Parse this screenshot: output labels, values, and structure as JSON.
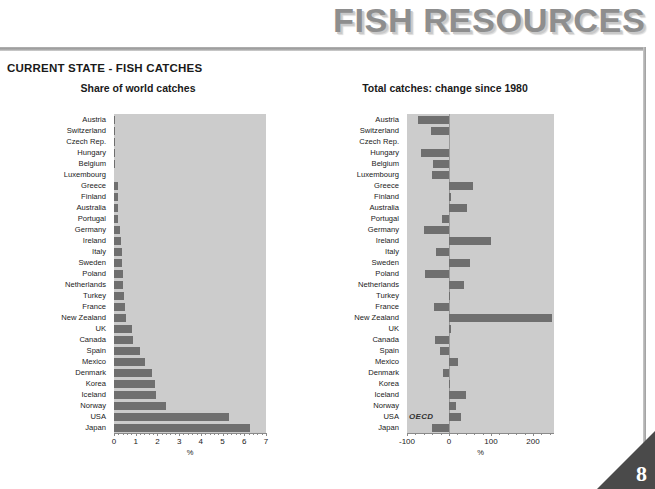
{
  "banner": {
    "title": "FISH RESOURCES"
  },
  "section": {
    "title": "CURRENT STATE - FISH CATCHES"
  },
  "page": {
    "number": "8"
  },
  "annotations": {
    "oecd_label": "OECD"
  },
  "chart_data": [
    {
      "id": "share-of-world-catches",
      "type": "bar",
      "orientation": "horizontal",
      "title": "Share of world catches",
      "xlabel": "%",
      "ylabel": "",
      "xlim": [
        0,
        7
      ],
      "xticks": [
        0,
        1,
        2,
        3,
        4,
        5,
        6,
        7
      ],
      "xticklabels": [
        "0",
        "1",
        "2",
        "3",
        "4",
        "5",
        "6",
        "7"
      ],
      "grid": false,
      "legend": "none",
      "bar_color": "#6f6f6f",
      "plot_background": "#cccccc",
      "categories": [
        "Austria",
        "Switzerland",
        "Czech Rep.",
        "Hungary",
        "Belgium",
        "Luxembourg",
        "Greece",
        "Finland",
        "Australia",
        "Portugal",
        "Germany",
        "Ireland",
        "Italy",
        "Sweden",
        "Poland",
        "Netherlands",
        "Turkey",
        "France",
        "New Zealand",
        "UK",
        "Canada",
        "Spain",
        "Mexico",
        "Denmark",
        "Korea",
        "Iceland",
        "Norway",
        "USA",
        "Japan"
      ],
      "values": [
        0.01,
        0.01,
        0.02,
        0.02,
        0.03,
        0.0,
        0.17,
        0.18,
        0.19,
        0.2,
        0.29,
        0.33,
        0.36,
        0.38,
        0.4,
        0.43,
        0.46,
        0.52,
        0.56,
        0.82,
        0.86,
        1.18,
        1.42,
        1.75,
        1.9,
        1.93,
        2.4,
        5.3,
        6.25
      ]
    },
    {
      "id": "total-catches-change-since-1980",
      "type": "bar",
      "orientation": "horizontal",
      "title": "Total catches: change since 1980",
      "xlabel": "%",
      "ylabel": "",
      "xlim": [
        -100,
        250
      ],
      "xticks": [
        -100,
        0,
        100,
        200
      ],
      "xticklabels": [
        "-100",
        "0",
        "100",
        "200"
      ],
      "grid": false,
      "legend": "none",
      "bar_color": "#6f6f6f",
      "plot_background": "#cccccc",
      "zero_reference": 0,
      "categories": [
        "Austria",
        "Switzerland",
        "Czech Rep.",
        "Hungary",
        "Belgium",
        "Luxembourg",
        "Greece",
        "Finland",
        "Australia",
        "Portugal",
        "Germany",
        "Ireland",
        "Italy",
        "Sweden",
        "Poland",
        "Netherlands",
        "Turkey",
        "France",
        "New Zealand",
        "UK",
        "Canada",
        "Spain",
        "Mexico",
        "Denmark",
        "Korea",
        "Iceland",
        "Norway",
        "USA",
        "Japan"
      ],
      "values": [
        -75,
        -44,
        0,
        -66,
        -37,
        -40,
        58,
        4,
        42,
        -16,
        -60,
        100,
        -32,
        49,
        -56,
        36,
        3,
        -36,
        245,
        5,
        -34,
        -22,
        21,
        -15,
        2,
        40,
        16,
        29,
        -40
      ]
    }
  ]
}
